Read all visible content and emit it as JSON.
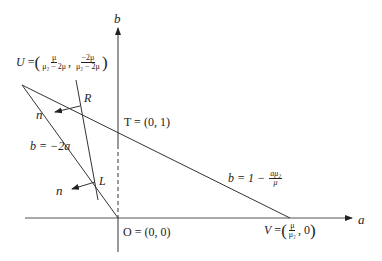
{
  "diagram": {
    "axes": {
      "x_label": "a",
      "y_label": "b"
    },
    "points": {
      "U": {
        "name": "U",
        "eq": "=",
        "x_num": "μ",
        "x_den": "μ₂ − 2μ",
        "sep": ",",
        "y_num": "−2μ",
        "y_den": "μ₂ − 2μ"
      },
      "R": {
        "name": "R"
      },
      "L": {
        "name": "L"
      },
      "T": {
        "text": "T = (0, 1)"
      },
      "O": {
        "text": "O = (0, 0)"
      },
      "V": {
        "name": "V",
        "eq": "=",
        "x_num": "μ",
        "x_den": "μ₂",
        "sep": ", 0"
      }
    },
    "lines": {
      "steep": {
        "text": "b = −2a"
      },
      "shallow": {
        "lhs": "b = 1 −",
        "num": "aμ₂",
        "den": "μ"
      }
    },
    "normals": [
      {
        "label": "n"
      },
      {
        "label": "n"
      }
    ],
    "colors": {
      "stroke": "#222222",
      "background": "#ffffff"
    }
  }
}
